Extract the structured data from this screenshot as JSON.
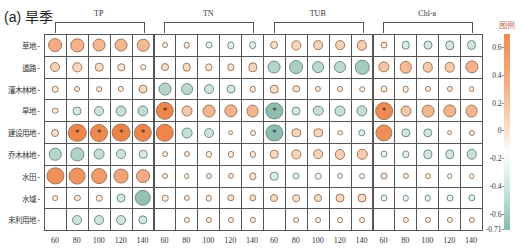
{
  "title": "(a) 旱季",
  "legend": {
    "title": "图例",
    "ticks": [
      "0.6",
      "0.4",
      "0.2",
      "0",
      "-0.2",
      "-0.4",
      "-0.6",
      "-0.71"
    ],
    "range": [
      -0.71,
      0.7
    ]
  },
  "chart_data": {
    "type": "heatmap",
    "subtype": "circle-correlation-matrix",
    "title": "(a) 旱季",
    "legend_title": "图例",
    "color_range": [
      -0.71,
      0.7
    ],
    "groups": [
      {
        "name": "TP",
        "columns": [
          "60",
          "80",
          "100",
          "120",
          "140"
        ]
      },
      {
        "name": "TN",
        "columns": [
          "60",
          "80",
          "100",
          "120",
          "140"
        ]
      },
      {
        "name": "TUB",
        "columns": [
          "60",
          "80",
          "100",
          "120",
          "140"
        ]
      },
      {
        "name": "Chl-a",
        "columns": [
          "60",
          "80",
          "100",
          "120",
          "140"
        ]
      }
    ],
    "x_ticks": [
      "60",
      "80",
      "100",
      "120",
      "140",
      "60",
      "80",
      "100",
      "120",
      "140",
      "60",
      "80",
      "100",
      "120",
      "140",
      "60",
      "80",
      "100",
      "120",
      "140"
    ],
    "rows": [
      "草地",
      "道路",
      "灌木林地",
      "旱地",
      "建设用地",
      "乔木林地",
      "水田",
      "水域",
      "未利用地"
    ],
    "values": [
      [
        0.45,
        0.42,
        0.4,
        0.4,
        0.38,
        0.05,
        0.08,
        -0.1,
        -0.12,
        -0.14,
        0.15,
        0.22,
        0.24,
        0.24,
        0.27,
        0.1,
        -0.18,
        -0.2,
        -0.22,
        -0.25
      ],
      [
        0.25,
        0.22,
        0.18,
        0.12,
        0.03,
        0.15,
        0.18,
        0.12,
        0.12,
        0.22,
        -0.4,
        -0.45,
        -0.35,
        -0.35,
        -0.48,
        0.32,
        0.38,
        0.28,
        0.28,
        0.42
      ],
      [
        0.08,
        0.05,
        0.04,
        0.06,
        0.2,
        -0.4,
        -0.35,
        -0.25,
        -0.2,
        0.08,
        0.18,
        0.12,
        0.06,
        0.05,
        0.03,
        0.1,
        0.08,
        0.06,
        0.06,
        0.04
      ],
      [
        0.08,
        -0.2,
        -0.25,
        -0.3,
        -0.32,
        0.68,
        0.3,
        0.4,
        0.42,
        0.4,
        -0.62,
        -0.2,
        -0.28,
        -0.3,
        -0.32,
        0.65,
        0.3,
        0.4,
        0.42,
        0.4
      ],
      [
        0.15,
        0.68,
        0.66,
        0.7,
        0.68,
        0.68,
        -0.3,
        -0.25,
        0.04,
        0.05,
        -0.62,
        0.22,
        0.22,
        0.03,
        -0.12,
        0.62,
        -0.22,
        -0.22,
        0.04,
        0.06
      ],
      [
        -0.38,
        -0.42,
        -0.3,
        -0.25,
        -0.18,
        0.04,
        0.05,
        0.06,
        0.06,
        0.06,
        0.18,
        0.22,
        0.24,
        0.26,
        0.28,
        -0.1,
        -0.12,
        -0.22,
        -0.22,
        -0.28
      ],
      [
        0.62,
        0.6,
        0.55,
        0.5,
        0.45,
        0.05,
        0.03,
        0.05,
        0.06,
        0.12,
        -0.18,
        -0.1,
        -0.08,
        -0.06,
        -0.04,
        0.1,
        0.06,
        0.04,
        0.04,
        0.03
      ],
      [
        0.04,
        0.06,
        0.08,
        -0.2,
        -0.58,
        0.08,
        0.06,
        0.08,
        0.12,
        0.12,
        0.15,
        0.14,
        0.15,
        0.2,
        0.2,
        -0.1,
        -0.08,
        -0.08,
        -0.1,
        -0.12
      ],
      [
        null,
        -0.25,
        -0.25,
        -0.25,
        -0.22,
        null,
        0.06,
        0.06,
        0.06,
        0.06,
        null,
        0.04,
        0.04,
        0.04,
        0.04,
        null,
        0.06,
        0.06,
        0.06,
        0.06
      ]
    ],
    "significant": [
      [
        3,
        5
      ],
      [
        3,
        10
      ],
      [
        3,
        15
      ],
      [
        4,
        1
      ],
      [
        4,
        2
      ],
      [
        4,
        3
      ],
      [
        4,
        4
      ],
      [
        4,
        10
      ]
    ],
    "significance_marker": "*"
  }
}
